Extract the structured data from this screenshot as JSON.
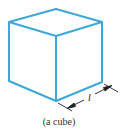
{
  "figure": {
    "caption": "(a cube)",
    "dimension_label": "l",
    "colors": {
      "edge": "#3ba8d8",
      "dimension": "#222222",
      "caption": "#333333"
    },
    "vertices": {
      "top_back": [
        56,
        9
      ],
      "top_left": [
        9,
        22
      ],
      "top_right": [
        102,
        22
      ],
      "top_front": [
        56,
        36
      ],
      "bottom_left": [
        9,
        81
      ],
      "bottom_right": [
        102,
        82
      ],
      "bottom_front": [
        56,
        101
      ]
    },
    "edges": [
      [
        "top_back",
        "top_left"
      ],
      [
        "top_back",
        "top_right"
      ],
      [
        "top_left",
        "top_front"
      ],
      [
        "top_right",
        "top_front"
      ],
      [
        "top_left",
        "bottom_left"
      ],
      [
        "top_front",
        "bottom_front"
      ],
      [
        "top_right",
        "bottom_right"
      ],
      [
        "bottom_left",
        "bottom_front"
      ],
      [
        "bottom_front",
        "bottom_right"
      ]
    ]
  }
}
